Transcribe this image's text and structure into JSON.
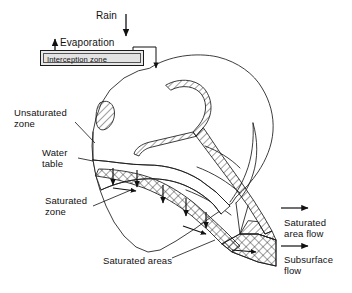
{
  "figure": {
    "type": "hydrological-catchment-block-diagram",
    "background_color": "#ffffff",
    "line_color": "#1a1a1a"
  },
  "labels": {
    "rain": "Rain",
    "evaporation": "Evaporation",
    "interception_zone": "Interception zone",
    "unsaturated_zone": "Unsaturated\nzone",
    "water_table": "Water\ntable",
    "saturated_zone": "Saturated\nzone",
    "saturated_areas": "Saturated areas",
    "saturated_area_flow": "Saturated\narea flow",
    "subsurface_flow": "Subsurface\nflow"
  },
  "boxes": {
    "interception": {
      "label": "Interception zone",
      "fill": "#e8e8e8",
      "border": "#1a1a1a",
      "double_border": true
    }
  },
  "arrows": {
    "rain_down": {
      "name": "rain-arrow",
      "direction": "down"
    },
    "evaporation_up": {
      "name": "evaporation-arrow",
      "direction": "up"
    },
    "throughfall_down": {
      "name": "throughfall-arrow",
      "direction": "down"
    },
    "infiltration": {
      "name": "infiltration-arrows",
      "direction": "down",
      "count": 5
    },
    "groundwater": {
      "name": "groundwater-flow-arrows",
      "direction": "right",
      "count": 3
    },
    "saturated_area_flow": {
      "name": "saturated-area-flow-arrow",
      "direction": "right"
    },
    "subsurface_flow": {
      "name": "subsurface-flow-arrow",
      "direction": "right"
    }
  },
  "zones": {
    "stream_network": {
      "name": "stream-network",
      "fill_pattern": "diagonal-hatch"
    },
    "saturated": {
      "name": "saturated-zone-band",
      "fill_pattern": "cross-hatch"
    },
    "unsaturated": {
      "name": "unsaturated-zone",
      "fill_pattern": "none"
    }
  }
}
